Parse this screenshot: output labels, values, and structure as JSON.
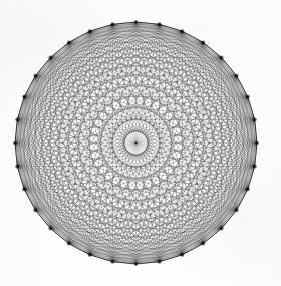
{
  "figure": {
    "title": "Complete graph drawn on the vertices of a regular polygon",
    "kind": "geometric-line-drawing",
    "medium": "scanned black ink line drawing on white paper"
  },
  "geometry": {
    "vertex_count": 32,
    "center_x": 136,
    "center_y": 143,
    "radius": 121,
    "start_angle_deg": -90,
    "edge_count": 496,
    "main_diagonal_count": 16,
    "symmetry_order": 32,
    "vertices_at_cardinal_points": true
  },
  "style": {
    "background_color": "#fdfdfd",
    "line_color": "#1a1a1a",
    "line_width": 0.34,
    "line_opacity": 0.72,
    "rim_color": "#0d0d0d",
    "rim_width": 0.9,
    "vertex_dot_color": "#111111",
    "vertex_dot_radius": 2.0,
    "vertex_dot_opacity": 0.62,
    "center_dot_color": "#111111",
    "center_dot_radius": 1.3
  },
  "canvas": {
    "width": 281,
    "height": 286
  }
}
